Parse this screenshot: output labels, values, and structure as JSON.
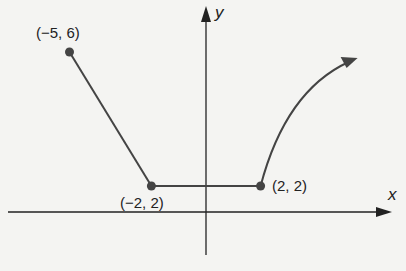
{
  "chart_data": {
    "type": "line",
    "title": "",
    "xlabel": "x",
    "ylabel": "y",
    "points": [
      {
        "x": -5,
        "y": 6,
        "label": "(−5, 6)"
      },
      {
        "x": -2,
        "y": 2,
        "label": "(−2, 2)"
      },
      {
        "x": 2,
        "y": 2,
        "label": "(2, 2)"
      }
    ],
    "segments": [
      {
        "from": [
          -5,
          6
        ],
        "to": [
          -2,
          2
        ],
        "kind": "line"
      },
      {
        "from": [
          -2,
          2
        ],
        "to": [
          2,
          2
        ],
        "kind": "line"
      },
      {
        "from": [
          2,
          2
        ],
        "kind": "curve-increasing",
        "arrow": true
      }
    ],
    "colors": {
      "line": "#444444",
      "point": "#444444",
      "axis": "#222222"
    }
  }
}
